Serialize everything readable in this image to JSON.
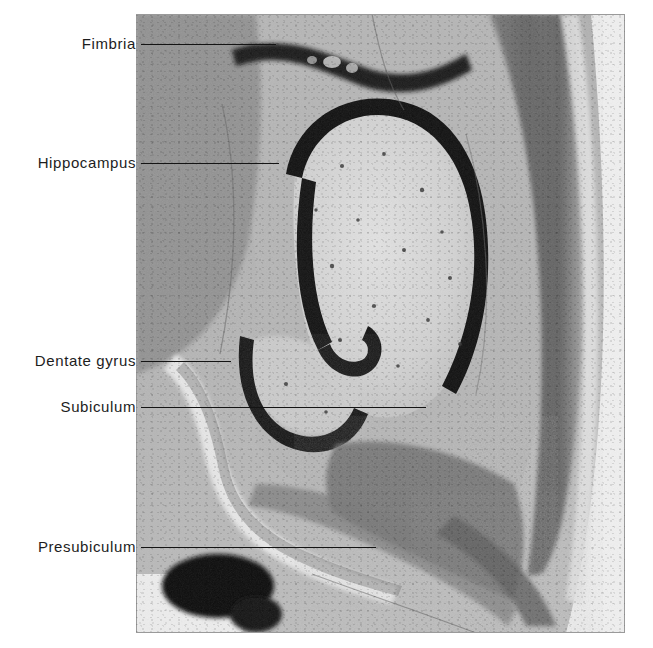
{
  "figure": {
    "kind": "histology-photomicrograph",
    "stain_appearance": "grayscale cell-body stain",
    "plate": {
      "left": 136,
      "top": 14,
      "width": 489,
      "height": 619
    },
    "background_color": "#ffffff",
    "line_color": "#141414",
    "text_color": "#1d1d1d"
  },
  "labels": [
    {
      "id": "fimbria",
      "text": "Fimbria",
      "text_right": 136,
      "text_y": 43,
      "line_x1": 141,
      "line_x2": 276,
      "line_y": 44
    },
    {
      "id": "hippocampus",
      "text": "Hippocampus",
      "text_right": 136,
      "text_y": 162,
      "line_x1": 141,
      "line_x2": 279,
      "line_y": 163
    },
    {
      "id": "dentate-gyrus",
      "text": "Dentate gyrus",
      "text_right": 136,
      "text_y": 360,
      "line_x1": 141,
      "line_x2": 231,
      "line_y": 361
    },
    {
      "id": "subiculum",
      "text": "Subiculum",
      "text_right": 136,
      "text_y": 406,
      "line_x1": 141,
      "line_x2": 426,
      "line_y": 407
    },
    {
      "id": "presubiculum",
      "text": "Presubiculum",
      "text_right": 136,
      "text_y": 546,
      "line_x1": 141,
      "line_x2": 376,
      "line_y": 547
    }
  ],
  "tissue_regions": [
    {
      "name": "fimbria-band",
      "tone": "#1a1a1a",
      "note": "dark wavy fiber band across top"
    },
    {
      "name": "hippocampal-pyramidal-band",
      "tone": "#111111",
      "note": "dark C-shaped cell band with inward hook"
    },
    {
      "name": "dentate-granule-band",
      "tone": "#101010",
      "note": "dark U-shaped granule layer, lower left of hippocampus"
    },
    {
      "name": "stratum-lucidum-field",
      "tone": "#d6d6d6",
      "note": "pale field enclosed by pyramidal band"
    },
    {
      "name": "cortical-ribbon",
      "tone": "#6e6e6e",
      "note": "dense granular cortex along right margin"
    },
    {
      "name": "white-matter-core",
      "tone": "#b3b3b3",
      "note": "mid-gray medullary core"
    },
    {
      "name": "ventricle-cleft",
      "tone": "#e8e8e8",
      "note": "pale cleft running lower-left diagonally"
    },
    {
      "name": "dark-oval-tract",
      "tone": "#0d0d0d",
      "note": "very dark oval mass at lower left"
    },
    {
      "name": "pial-edge",
      "tone": "#f2f2f2",
      "note": "light halo outside cortex on right"
    }
  ]
}
